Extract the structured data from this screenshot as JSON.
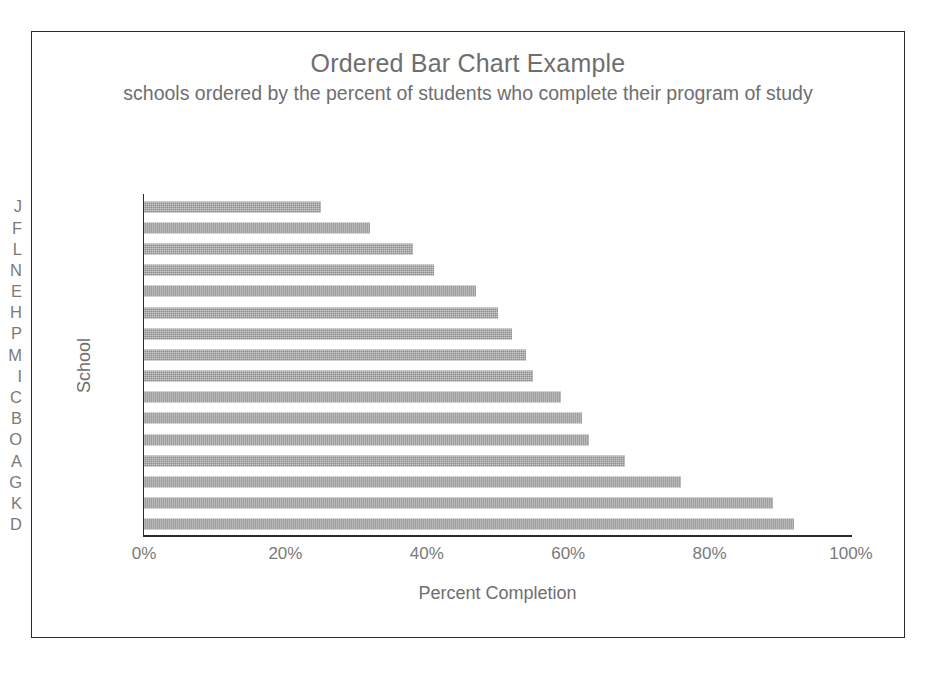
{
  "chart_data": {
    "type": "bar",
    "orientation": "horizontal",
    "title": "Ordered Bar Chart Example",
    "subtitle": "schools ordered by the percent of students who complete their program of study",
    "xlabel": "Percent Completion",
    "ylabel": "School",
    "xlim": [
      0,
      100
    ],
    "grid": false,
    "legend": null,
    "xticks": [
      "0%",
      "20%",
      "40%",
      "60%",
      "80%",
      "100%"
    ],
    "xtick_values": [
      0,
      20,
      40,
      60,
      80,
      100
    ],
    "categories": [
      "J",
      "F",
      "L",
      "N",
      "E",
      "H",
      "P",
      "M",
      "I",
      "C",
      "B",
      "O",
      "A",
      "G",
      "K",
      "D"
    ],
    "values": [
      25,
      32,
      38,
      41,
      47,
      50,
      52,
      54,
      55,
      59,
      62,
      63,
      68,
      76,
      89,
      92
    ],
    "value_unit": "%",
    "bars": [
      {
        "category": "J",
        "value": 25
      },
      {
        "category": "F",
        "value": 32
      },
      {
        "category": "L",
        "value": 38
      },
      {
        "category": "N",
        "value": 41
      },
      {
        "category": "E",
        "value": 47
      },
      {
        "category": "H",
        "value": 50
      },
      {
        "category": "P",
        "value": 52
      },
      {
        "category": "M",
        "value": 54
      },
      {
        "category": "I",
        "value": 55
      },
      {
        "category": "C",
        "value": 59
      },
      {
        "category": "B",
        "value": 62
      },
      {
        "category": "O",
        "value": 63
      },
      {
        "category": "A",
        "value": 68
      },
      {
        "category": "G",
        "value": 76
      },
      {
        "category": "K",
        "value": 89
      },
      {
        "category": "D",
        "value": 92
      }
    ],
    "colors": {
      "bar_fill": "#898989",
      "axis_line": "#2b2b2b",
      "text": "#6e6e6e",
      "tick_text": "#7a7a7a",
      "frame_border": "#2b2b2b",
      "background": "#ffffff"
    }
  }
}
